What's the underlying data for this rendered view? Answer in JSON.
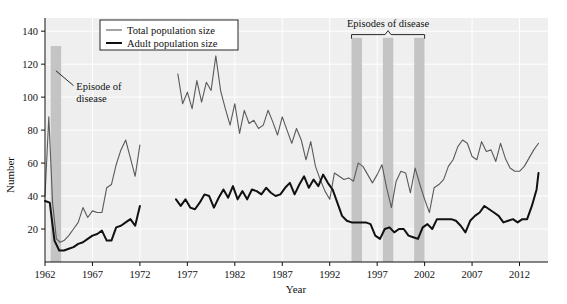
{
  "chart_data": {
    "type": "line",
    "title": "",
    "xlabel": "Year",
    "ylabel": "Number",
    "xlim": [
      1962,
      2015
    ],
    "ylim": [
      0,
      148
    ],
    "yticks": [
      20,
      40,
      60,
      80,
      100,
      120,
      140
    ],
    "xticks": [
      1962,
      1967,
      1972,
      1977,
      1982,
      1987,
      1992,
      1997,
      2002,
      2007,
      2012
    ],
    "grid": true,
    "legend_position": "top-left",
    "legend": [
      {
        "name": "Total population size",
        "color": "#5a5a5a",
        "width": 1.1
      },
      {
        "name": "Adult population size",
        "color": "#111111",
        "width": 2.0
      }
    ],
    "annotations": [
      {
        "name": "episode-of-disease",
        "text_line1": "Episode of",
        "text_line2": "disease",
        "x": 1965.2,
        "y": 106
      },
      {
        "name": "episodes-of-disease",
        "text": "Episodes of disease",
        "x": 1996.5,
        "y": 143
      }
    ],
    "shaded_bands": [
      {
        "name": "band-1963",
        "x0": 1962.6,
        "x1": 1963.7,
        "y_top": 131,
        "color": "#c4c4c4"
      },
      {
        "name": "band-1994",
        "x0": 1994.3,
        "x1": 1995.4,
        "y_top": 136,
        "color": "#c4c4c4"
      },
      {
        "name": "band-1998",
        "x0": 1997.6,
        "x1": 1998.7,
        "y_top": 136,
        "color": "#c4c4c4"
      },
      {
        "name": "band-2001",
        "x0": 2000.9,
        "x1": 2002.0,
        "y_top": 136,
        "color": "#c4c4c4"
      }
    ],
    "series": [
      {
        "name": "Total population size",
        "color": "#5a5a5a",
        "segments": [
          {
            "x": [
              1962,
              1962.4,
              1962.8,
              1963.2,
              1963.6,
              1964,
              1964.5,
              1965,
              1965.5,
              1966,
              1966.5,
              1967,
              1967.5,
              1968,
              1968.5,
              1969,
              1969.5,
              1970,
              1970.5,
              1971,
              1971.5,
              1972
            ],
            "y": [
              40,
              88,
              36,
              14,
              12,
              13,
              16,
              20,
              24,
              33,
              27,
              31,
              30,
              30,
              45,
              47,
              59,
              68,
              74,
              63,
              52,
              71
            ]
          },
          {
            "x": [
              1976,
              1976.5,
              1977,
              1977.5,
              1978,
              1978.5,
              1979,
              1979.5,
              1980,
              1980.5,
              1981,
              1981.5,
              1982,
              1982.5,
              1983,
              1983.5,
              1984,
              1984.5,
              1985,
              1985.5,
              1986,
              1986.5,
              1987,
              1987.5,
              1988,
              1988.5,
              1989,
              1989.5,
              1990,
              1990.5,
              1991,
              1991.5,
              1992,
              1992.5,
              1993,
              1993.5,
              1994,
              1994.5,
              1995,
              1995.5,
              1996,
              1996.5,
              1997,
              1997.5,
              1998,
              1998.5,
              1999,
              1999.5,
              2000,
              2000.5,
              2001,
              2001.5,
              2002,
              2002.5,
              2003,
              2003.5,
              2004,
              2004.5,
              2005,
              2005.5,
              2006,
              2006.5,
              2007,
              2007.5,
              2008,
              2008.5,
              2009,
              2009.5,
              2010,
              2010.5,
              2011,
              2011.5,
              2012,
              2012.5,
              2013,
              2013.5,
              2014
            ],
            "y": [
              114,
              96,
              103,
              93,
              110,
              97,
              109,
              104,
              125,
              104,
              93,
              83,
              96,
              78,
              92,
              84,
              86,
              81,
              83,
              92,
              85,
              77,
              88,
              80,
              72,
              81,
              74,
              62,
              73,
              58,
              50,
              43,
              38,
              54,
              52,
              50,
              51,
              49,
              60,
              58,
              53,
              48,
              53,
              59,
              45,
              33,
              49,
              55,
              54,
              42,
              57,
              47,
              38,
              30,
              45,
              47,
              50,
              58,
              62,
              70,
              74,
              72,
              64,
              62,
              73,
              67,
              68,
              61,
              72,
              63,
              57,
              55,
              55,
              58,
              63,
              68,
              72
            ]
          }
        ]
      },
      {
        "name": "Adult population size",
        "color": "#111111",
        "segments": [
          {
            "x": [
              1962,
              1962.5,
              1963,
              1963.5,
              1964,
              1964.5,
              1965,
              1965.5,
              1966,
              1966.5,
              1967,
              1967.5,
              1968,
              1968.5,
              1969,
              1969.5,
              1970,
              1970.5,
              1971,
              1971.5,
              1972
            ],
            "y": [
              37,
              36,
              13,
              7,
              7,
              8,
              9,
              11,
              12,
              14,
              16,
              17,
              19,
              13,
              13,
              21,
              22,
              24,
              26,
              22,
              34
            ]
          },
          {
            "x": [
              1975.8,
              1976.3,
              1976.8,
              1977.3,
              1977.8,
              1978.3,
              1978.8,
              1979.3,
              1979.8,
              1980.3,
              1980.8,
              1981.3,
              1981.8,
              1982.3,
              1982.8,
              1983.3,
              1983.8,
              1984.3,
              1984.8,
              1985.3,
              1985.8,
              1986.3,
              1986.8,
              1987.3,
              1987.8,
              1988.3,
              1988.8,
              1989.3,
              1989.8,
              1990.3,
              1990.8,
              1991.3,
              1991.8,
              1992.3,
              1992.8,
              1993.3,
              1993.8,
              1994.3,
              1994.8,
              1995.3,
              1995.8,
              1996.3,
              1996.8,
              1997.3,
              1997.8,
              1998.3,
              1998.8,
              1999.3,
              1999.8,
              2000.3,
              2000.8,
              2001.3,
              2001.8,
              2002.3,
              2002.8,
              2003.3,
              2003.8,
              2004.3,
              2004.8,
              2005.3,
              2005.8,
              2006.3,
              2006.8,
              2007.3,
              2007.8,
              2008.3,
              2008.8,
              2009.3,
              2009.8,
              2010.3,
              2010.8,
              2011.3,
              2011.8,
              2012.3,
              2012.8,
              2013.3,
              2013.8,
              2014
            ],
            "y": [
              38,
              34,
              38,
              33,
              32,
              36,
              41,
              40,
              33,
              39,
              44,
              39,
              46,
              38,
              43,
              38,
              44,
              43,
              41,
              45,
              42,
              40,
              41,
              45,
              48,
              41,
              47,
              52,
              45,
              50,
              46,
              53,
              48,
              44,
              36,
              28,
              25,
              24,
              24,
              24,
              24,
              23,
              16,
              14,
              20,
              21,
              18,
              20,
              20,
              16,
              15,
              14,
              21,
              23,
              20,
              26,
              26,
              26,
              26,
              25,
              22,
              18,
              25,
              28,
              30,
              34,
              32,
              30,
              28,
              24,
              25,
              26,
              24,
              26,
              26,
              34,
              44,
              54
            ]
          }
        ]
      }
    ]
  },
  "layout": {
    "plot_left": 45,
    "plot_right": 548,
    "plot_top": 18,
    "plot_bottom": 262,
    "plot_bg": "#efefef",
    "grid_color": "#ffffff",
    "axis_color": "#111111"
  }
}
